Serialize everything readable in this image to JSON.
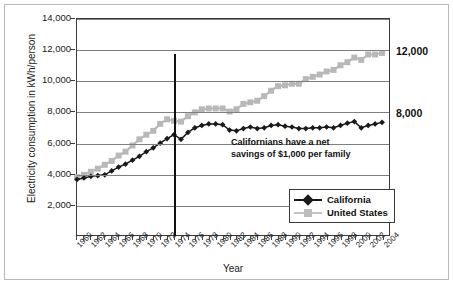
{
  "chart_data": {
    "type": "line",
    "title": "",
    "xlabel": "Year",
    "ylabel": "Electricity consumption in kWh/person",
    "xlim": [
      1960,
      2005
    ],
    "ylim": [
      0,
      14000
    ],
    "ytick_labels": [
      "14,000",
      "12,000",
      "10,000",
      "8,000",
      "6,000",
      "4,000",
      "2,000"
    ],
    "ytick_values": [
      14000,
      12000,
      10000,
      8000,
      6000,
      4000,
      2000
    ],
    "xtick_labels": [
      "1960",
      "1962",
      "1964",
      "1966",
      "1968",
      "1970",
      "1972",
      "1974",
      "1976",
      "1978",
      "1980",
      "1982",
      "1984",
      "1986",
      "1988",
      "1990",
      "1992",
      "1994",
      "1996",
      "1998",
      "2000",
      "2002",
      "2004"
    ],
    "grid": "horizontal",
    "legend_position": "bottom-right",
    "x": [
      1960,
      1961,
      1962,
      1963,
      1964,
      1965,
      1966,
      1967,
      1968,
      1969,
      1970,
      1971,
      1972,
      1973,
      1974,
      1975,
      1976,
      1977,
      1978,
      1979,
      1980,
      1981,
      1982,
      1983,
      1984,
      1985,
      1986,
      1987,
      1988,
      1989,
      1990,
      1991,
      1992,
      1993,
      1994,
      1995,
      1996,
      1997,
      1998,
      1999,
      2000,
      2001,
      2002,
      2003,
      2004
    ],
    "series": [
      {
        "name": "California",
        "color": "#1a1a1a",
        "marker": "diamond",
        "values": [
          3600,
          3700,
          3800,
          3850,
          3900,
          4150,
          4400,
          4600,
          4850,
          5100,
          5400,
          5650,
          5950,
          6250,
          6500,
          6200,
          6650,
          6950,
          7100,
          7200,
          7200,
          7150,
          6800,
          6750,
          6900,
          7000,
          6900,
          6950,
          7100,
          7150,
          7050,
          7000,
          6900,
          6900,
          6950,
          6950,
          7000,
          6950,
          7100,
          7250,
          7350,
          6950,
          7100,
          7200,
          7300
        ]
      },
      {
        "name": "United States",
        "color": "#b8b8b8",
        "marker": "square",
        "values": [
          3750,
          3900,
          4100,
          4300,
          4550,
          4800,
          5150,
          5400,
          5800,
          6200,
          6500,
          6750,
          7200,
          7500,
          7400,
          7350,
          7700,
          7950,
          8150,
          8200,
          8200,
          8200,
          8000,
          8150,
          8500,
          8600,
          8700,
          9000,
          9350,
          9650,
          9700,
          9800,
          9800,
          10100,
          10250,
          10400,
          10600,
          10700,
          11000,
          11200,
          11500,
          11350,
          11700,
          11700,
          11800
        ]
      }
    ],
    "annotation": {
      "line1": "Californians have a net",
      "line2": "savings of $1,000 per family"
    },
    "event_line": {
      "year": 1974,
      "top_value": 11700
    },
    "right_labels": [
      {
        "text": "12,000",
        "value": 11800
      },
      {
        "text": "8,000",
        "value": 7850
      }
    ]
  }
}
